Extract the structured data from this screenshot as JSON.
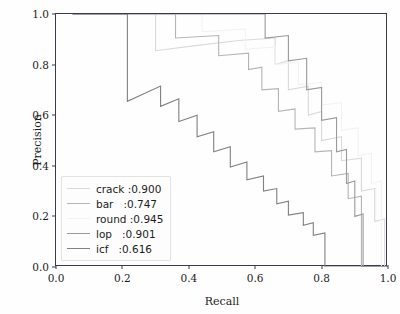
{
  "chart_data": {
    "type": "line",
    "title": "",
    "xlabel": "Recall",
    "ylabel": "Precision",
    "xlim": [
      0.0,
      1.0
    ],
    "ylim": [
      0.0,
      1.0
    ],
    "xticks": [
      "0.0",
      "0.2",
      "0.4",
      "0.6",
      "0.8",
      "1.0"
    ],
    "yticks": [
      "0.0",
      "0.2",
      "0.4",
      "0.6",
      "0.8",
      "1.0"
    ],
    "grid": false,
    "legend_position": "lower left",
    "step_style": "post",
    "series": [
      {
        "name": "crack",
        "legend_label": "crack :0.900",
        "ap": 0.9,
        "color": "#d9d9d9",
        "points": [
          [
            0.05,
            1.0
          ],
          [
            0.3,
            1.0
          ],
          [
            0.3,
            0.855
          ],
          [
            0.42,
            0.875
          ],
          [
            0.55,
            0.895
          ],
          [
            0.66,
            0.905
          ],
          [
            0.66,
            0.8
          ],
          [
            0.7,
            0.815
          ],
          [
            0.7,
            0.7
          ],
          [
            0.76,
            0.715
          ],
          [
            0.76,
            0.6
          ],
          [
            0.8,
            0.615
          ],
          [
            0.8,
            0.5
          ],
          [
            0.86,
            0.515
          ],
          [
            0.86,
            0.42
          ],
          [
            0.92,
            0.43
          ],
          [
            0.92,
            0.3
          ],
          [
            0.96,
            0.31
          ],
          [
            0.96,
            0.18
          ],
          [
            0.99,
            0.19
          ],
          [
            0.99,
            0.0
          ],
          [
            1.0,
            0.0
          ]
        ]
      },
      {
        "name": "bar",
        "legend_label": "bar   :0.747",
        "ap": 0.747,
        "color": "#b5b5b5",
        "points": [
          [
            0.05,
            1.0
          ],
          [
            0.36,
            1.0
          ],
          [
            0.36,
            0.905
          ],
          [
            0.49,
            0.915
          ],
          [
            0.49,
            0.835
          ],
          [
            0.58,
            0.845
          ],
          [
            0.58,
            0.78
          ],
          [
            0.62,
            0.79
          ],
          [
            0.62,
            0.7
          ],
          [
            0.67,
            0.705
          ],
          [
            0.67,
            0.615
          ],
          [
            0.72,
            0.625
          ],
          [
            0.72,
            0.545
          ],
          [
            0.78,
            0.55
          ],
          [
            0.78,
            0.455
          ],
          [
            0.83,
            0.46
          ],
          [
            0.83,
            0.36
          ],
          [
            0.88,
            0.37
          ],
          [
            0.88,
            0.27
          ],
          [
            0.92,
            0.28
          ],
          [
            0.92,
            0.0
          ],
          [
            1.0,
            0.0
          ]
        ]
      },
      {
        "name": "round",
        "legend_label": "round :0.945",
        "ap": 0.945,
        "color": "#f2f2f2",
        "points": [
          [
            0.05,
            1.0
          ],
          [
            0.44,
            1.0
          ],
          [
            0.44,
            0.93
          ],
          [
            0.57,
            0.94
          ],
          [
            0.57,
            0.86
          ],
          [
            0.66,
            0.87
          ],
          [
            0.66,
            0.8
          ],
          [
            0.73,
            0.81
          ],
          [
            0.73,
            0.72
          ],
          [
            0.8,
            0.73
          ],
          [
            0.8,
            0.64
          ],
          [
            0.86,
            0.65
          ],
          [
            0.86,
            0.54
          ],
          [
            0.91,
            0.55
          ],
          [
            0.91,
            0.44
          ],
          [
            0.95,
            0.45
          ],
          [
            0.95,
            0.33
          ],
          [
            0.98,
            0.34
          ],
          [
            0.98,
            0.0
          ],
          [
            1.0,
            0.0
          ]
        ]
      },
      {
        "name": "lop",
        "legend_label": "lop   :0.901",
        "ap": 0.901,
        "color": "#9a9a9a",
        "points": [
          [
            0.05,
            1.0
          ],
          [
            0.63,
            1.0
          ],
          [
            0.63,
            0.905
          ],
          [
            0.7,
            0.915
          ],
          [
            0.7,
            0.815
          ],
          [
            0.755,
            0.825
          ],
          [
            0.755,
            0.7
          ],
          [
            0.8,
            0.71
          ],
          [
            0.8,
            0.58
          ],
          [
            0.845,
            0.59
          ],
          [
            0.845,
            0.455
          ],
          [
            0.875,
            0.465
          ],
          [
            0.875,
            0.33
          ],
          [
            0.9,
            0.34
          ],
          [
            0.9,
            0.2
          ],
          [
            0.925,
            0.21
          ],
          [
            0.925,
            0.0
          ],
          [
            1.0,
            0.0
          ]
        ]
      },
      {
        "name": "icf",
        "legend_label": "icf   :0.616",
        "ap": 0.616,
        "color": "#808080",
        "points": [
          [
            0.05,
            1.0
          ],
          [
            0.215,
            1.0
          ],
          [
            0.215,
            0.655
          ],
          [
            0.315,
            0.715
          ],
          [
            0.315,
            0.635
          ],
          [
            0.37,
            0.665
          ],
          [
            0.37,
            0.575
          ],
          [
            0.425,
            0.6
          ],
          [
            0.425,
            0.515
          ],
          [
            0.475,
            0.535
          ],
          [
            0.475,
            0.455
          ],
          [
            0.525,
            0.475
          ],
          [
            0.525,
            0.395
          ],
          [
            0.575,
            0.415
          ],
          [
            0.575,
            0.345
          ],
          [
            0.625,
            0.36
          ],
          [
            0.625,
            0.3
          ],
          [
            0.665,
            0.31
          ],
          [
            0.665,
            0.25
          ],
          [
            0.7,
            0.26
          ],
          [
            0.7,
            0.205
          ],
          [
            0.745,
            0.215
          ],
          [
            0.745,
            0.165
          ],
          [
            0.775,
            0.175
          ],
          [
            0.775,
            0.125
          ],
          [
            0.81,
            0.135
          ],
          [
            0.81,
            0.0
          ],
          [
            1.0,
            0.0
          ]
        ]
      }
    ]
  },
  "axis": {
    "xlabel": "Recall",
    "ylabel": "Precision"
  },
  "legend": {
    "entries": [
      {
        "label": "crack :0.900"
      },
      {
        "label": "bar   :0.747"
      },
      {
        "label": "round :0.945"
      },
      {
        "label": "lop   :0.901"
      },
      {
        "label": "icf   :0.616"
      }
    ]
  }
}
